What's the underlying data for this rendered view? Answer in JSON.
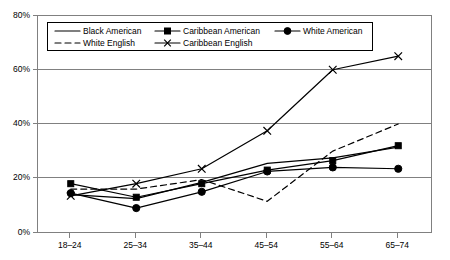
{
  "chart_data": {
    "type": "line",
    "title": "",
    "subtitle": "",
    "xlabel": "",
    "ylabel": "",
    "categories": [
      "18–24",
      "25–34",
      "35–44",
      "45–54",
      "55–64",
      "65–74"
    ],
    "x_tick_labels": [
      "18–24",
      "25–34",
      "35–44",
      "45–54",
      "55–64",
      "65–74"
    ],
    "y_tick_labels": [
      "0%",
      "20%",
      "40%",
      "60%",
      "80%"
    ],
    "y_tick_values": [
      0,
      20,
      40,
      60,
      80
    ],
    "ylim": [
      0,
      80
    ],
    "grid": "horizontal",
    "legend_position": "top-left-inside",
    "series": [
      {
        "name": "Black American",
        "style": "solid",
        "marker": "none",
        "color": "#000000",
        "values": [
          14.0,
          12.5,
          18.5,
          25.5,
          27.5,
          31.5
        ]
      },
      {
        "name": "Caribbean American",
        "style": "solid",
        "marker": "square",
        "color": "#000000",
        "values": [
          18.0,
          13.0,
          18.0,
          23.0,
          26.5,
          32.0
        ]
      },
      {
        "name": "White American",
        "style": "solid",
        "marker": "circle",
        "color": "#000000",
        "values": [
          14.5,
          9.0,
          15.0,
          22.5,
          24.0,
          23.5
        ]
      },
      {
        "name": "White English",
        "style": "dashed",
        "marker": "none",
        "color": "#000000",
        "values": [
          16.0,
          16.0,
          19.5,
          11.5,
          30.0,
          40.0
        ]
      },
      {
        "name": "Caribbean English",
        "style": "solid",
        "marker": "x",
        "color": "#000000",
        "values": [
          13.5,
          18.0,
          23.5,
          37.5,
          60.0,
          65.0
        ]
      }
    ]
  },
  "legend": {
    "entries": [
      {
        "label": "Black American"
      },
      {
        "label": "Caribbean American"
      },
      {
        "label": "White American"
      },
      {
        "label": "White English"
      },
      {
        "label": "Caribbean English"
      }
    ]
  },
  "axes": {
    "y_labels": [
      "80%",
      "60%",
      "40%",
      "20%",
      "0%"
    ],
    "x_labels": [
      "18–24",
      "25–34",
      "35–44",
      "45–54",
      "55–64",
      "65–74"
    ]
  }
}
